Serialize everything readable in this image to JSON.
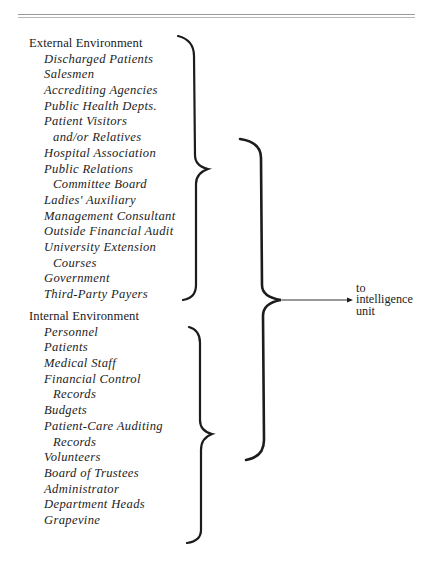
{
  "diagram": {
    "external": {
      "heading": "External Environment",
      "items": [
        {
          "text": "Discharged Patients",
          "cont": false
        },
        {
          "text": "Salesmen",
          "cont": false
        },
        {
          "text": "Accrediting Agencies",
          "cont": false
        },
        {
          "text": "Public Health Depts.",
          "cont": false
        },
        {
          "text": "Patient Visitors",
          "cont": false
        },
        {
          "text": "and/or Relatives",
          "cont": true
        },
        {
          "text": "Hospital Association",
          "cont": false
        },
        {
          "text": "Public Relations",
          "cont": false
        },
        {
          "text": "Committee Board",
          "cont": true
        },
        {
          "text": "Ladies' Auxiliary",
          "cont": false
        },
        {
          "text": "Management Consultant",
          "cont": false
        },
        {
          "text": "Outside Financial Audit",
          "cont": false
        },
        {
          "text": "University Extension",
          "cont": false
        },
        {
          "text": "Courses",
          "cont": true
        },
        {
          "text": "Government",
          "cont": false
        },
        {
          "text": "Third-Party Payers",
          "cont": false
        }
      ]
    },
    "internal": {
      "heading": "Internal Environment",
      "items": [
        {
          "text": "Personnel",
          "cont": false
        },
        {
          "text": "Patients",
          "cont": false
        },
        {
          "text": "Medical Staff",
          "cont": false
        },
        {
          "text": "Financial Control",
          "cont": false
        },
        {
          "text": "Records",
          "cont": true
        },
        {
          "text": "Budgets",
          "cont": false
        },
        {
          "text": "Patient-Care Auditing",
          "cont": false
        },
        {
          "text": "Records",
          "cont": true
        },
        {
          "text": "Volunteers",
          "cont": false
        },
        {
          "text": "Board of Trustees",
          "cont": false
        },
        {
          "text": "Administrator",
          "cont": false
        },
        {
          "text": "Department Heads",
          "cont": false
        },
        {
          "text": "Grapevine",
          "cont": false
        }
      ]
    },
    "target": {
      "lines": [
        "to",
        "intelligence",
        "unit"
      ]
    },
    "colors": {
      "ink": "#1c1c1c",
      "rule": "#9a9a9a",
      "background": "#ffffff"
    }
  }
}
